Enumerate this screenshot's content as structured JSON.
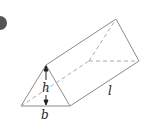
{
  "figure": {
    "type": "triangular-prism",
    "labels": {
      "height": "h",
      "base": "b",
      "length": "l"
    },
    "colors": {
      "edge": "#888888",
      "hidden_edge": "#aaaaaa",
      "label": "#222222",
      "badge": "#555555"
    }
  }
}
